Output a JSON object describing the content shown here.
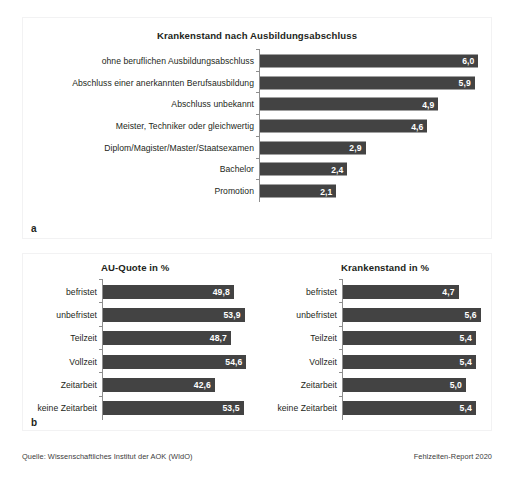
{
  "figure": {
    "panel_a_letter": "a",
    "panel_b_letter": "b",
    "source_note": "Quelle: Wissenschaftliches Institut der AOK (WIdO)",
    "report_note": "Fehlzeiten-Report 2020"
  },
  "chart_data": [
    {
      "id": "a",
      "type": "bar",
      "orientation": "horizontal",
      "title": "Krankenstand nach Ausbildungsabschluss",
      "xlabel": "",
      "ylabel": "",
      "grid": false,
      "legend": "none",
      "xlim": [
        0,
        6.4
      ],
      "bar_color": "#434343",
      "value_label_color": "#ffffff",
      "decimal_separator": ",",
      "categories": [
        "ohne beruflichen Ausbildungsabschluss",
        "Abschluss einer anerkannten Berufsausbildung",
        "Abschluss unbekannt",
        "Meister, Techniker oder gleichwertig",
        "Diplom/Magister/Master/Staatsexamen",
        "Bachelor",
        "Promotion"
      ],
      "values": [
        6.0,
        5.9,
        4.9,
        4.6,
        2.9,
        2.4,
        2.1
      ],
      "value_labels": [
        "6,0",
        "5,9",
        "4,9",
        "4,6",
        "2,9",
        "2,4",
        "2,1"
      ]
    },
    {
      "id": "b-left",
      "type": "bar",
      "orientation": "horizontal",
      "title": "AU-Quote in %",
      "xlabel": "",
      "ylabel": "",
      "grid": false,
      "legend": "none",
      "xlim": [
        0,
        59
      ],
      "bar_color": "#434343",
      "value_label_color": "#ffffff",
      "decimal_separator": ",",
      "categories": [
        "befristet",
        "unbefristet",
        "Teilzeit",
        "Vollzeit",
        "Zeitarbeit",
        "keine Zeitarbeit"
      ],
      "values": [
        49.8,
        53.9,
        48.7,
        54.6,
        42.6,
        53.5
      ],
      "value_labels": [
        "49,8",
        "53,9",
        "48,7",
        "54,6",
        "42,6",
        "53,5"
      ]
    },
    {
      "id": "b-right",
      "type": "bar",
      "orientation": "horizontal",
      "title": "Krankenstand in %",
      "xlabel": "",
      "ylabel": "",
      "grid": false,
      "legend": "none",
      "xlim": [
        0,
        6.1
      ],
      "bar_color": "#434343",
      "value_label_color": "#ffffff",
      "decimal_separator": ",",
      "categories": [
        "befristet",
        "unbefristet",
        "Teilzeit",
        "Vollzeit",
        "Zeitarbeit",
        "keine Zeitarbeit"
      ],
      "values": [
        4.7,
        5.6,
        5.4,
        5.4,
        5.0,
        5.4
      ],
      "value_labels": [
        "4,7",
        "5,6",
        "5,4",
        "5,4",
        "5,0",
        "5,4"
      ]
    }
  ]
}
